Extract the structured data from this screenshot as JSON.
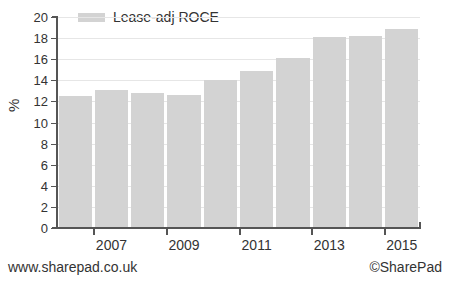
{
  "chart_data": {
    "type": "bar",
    "title": "",
    "subtitle": "",
    "xlabel": "",
    "ylabel": "%",
    "ylim": [
      0,
      20
    ],
    "ytick_step": 2,
    "yticks": [
      20,
      18,
      16,
      14,
      12,
      10,
      8,
      6,
      4,
      2,
      0
    ],
    "grid": true,
    "grid_axis": "y",
    "legend_position": "top-left",
    "categories": [
      2006,
      2007,
      2008,
      2009,
      2010,
      2011,
      2012,
      2013,
      2014,
      2015
    ],
    "xtick_labels": [
      "2007",
      "2009",
      "2011",
      "2013",
      "2015"
    ],
    "series": [
      {
        "name": "Lease-adj ROCE",
        "color": "#d3d3d3",
        "values": [
          12.5,
          13.1,
          12.8,
          12.6,
          14.0,
          14.9,
          16.1,
          18.1,
          18.2,
          18.9
        ]
      }
    ]
  },
  "legend": {
    "swatch_color": "#d3d3d3",
    "label": "Lease-adj ROCE"
  },
  "axes": {
    "y_title": "%",
    "axis_color": "#555555",
    "grid_color": "#e6e6e6"
  },
  "footer": {
    "left": "www.sharepad.co.uk",
    "right": "©SharePad"
  }
}
